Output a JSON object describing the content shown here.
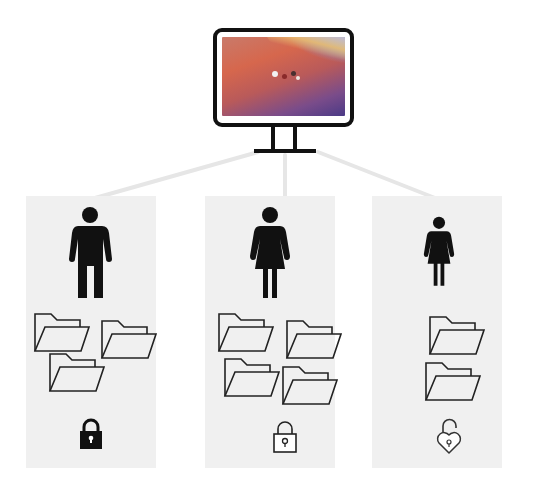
{
  "diagram": {
    "title": "",
    "root": {
      "type": "computer",
      "icon": "monitor-icon",
      "screen": "desktop-wallpaper"
    },
    "users": [
      {
        "id": "user-1",
        "figure": "man-icon",
        "folder_count": 3,
        "lock": "locked-padlock-filled-icon",
        "lock_state": "locked",
        "caption": ""
      },
      {
        "id": "user-2",
        "figure": "woman-icon",
        "folder_count": 4,
        "lock": "locked-padlock-outline-icon",
        "lock_state": "locked",
        "caption": ""
      },
      {
        "id": "user-3",
        "figure": "woman-small-icon",
        "folder_count": 2,
        "lock": "unlocked-heart-padlock-icon",
        "lock_state": "unlocked",
        "caption": ""
      }
    ],
    "colors": {
      "panel_bg": "#f0f0f0",
      "connector": "#e4e4e4",
      "icon_stroke": "#1a1a1a",
      "icon_fill": "#111111"
    }
  }
}
